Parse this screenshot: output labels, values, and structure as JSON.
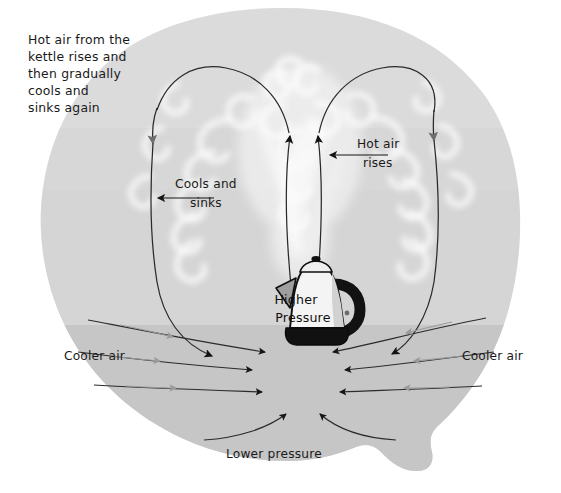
{
  "diagram": {
    "background_color": "#ffffff",
    "air_mass_upper_color": "#d6d6d6",
    "air_mass_lower_color": "#c6c6c6",
    "steam_color": "#fdfdfd",
    "arrow_color": "#1b1b1b",
    "arrow_color_faded": "#8f8f8f",
    "kettle": {
      "body_color": "#f2f2f2",
      "shade_color": "#b9b9b9",
      "handle_color": "#141414",
      "base_color": "#141414",
      "outline_color": "#0e0e0e"
    }
  },
  "labels": {
    "top_note": [
      "Hot air from the",
      "kettle rises and",
      "then gradually",
      "cools and",
      "sinks again"
    ],
    "cools_and_sinks": [
      "Cools and",
      "sinks"
    ],
    "hot_air_rises": [
      "Hot air",
      "rises"
    ],
    "higher_pressure": [
      "Higher",
      "Pressure"
    ],
    "lower_pressure": "Lower pressure",
    "cooler_air_left": "Cooler air",
    "cooler_air_right": "Cooler air"
  },
  "flow": {
    "loops": [
      {
        "name": "left-convection-loop",
        "direction": "counter-clockwise",
        "rise_side": "center",
        "sink_side": "left"
      },
      {
        "name": "right-convection-loop",
        "direction": "clockwise",
        "rise_side": "center",
        "sink_side": "right"
      }
    ],
    "ground_inflow_arrows_left": 4,
    "ground_inflow_arrows_right": 4,
    "convergence_point": {
      "x": 305,
      "y": 385
    }
  }
}
